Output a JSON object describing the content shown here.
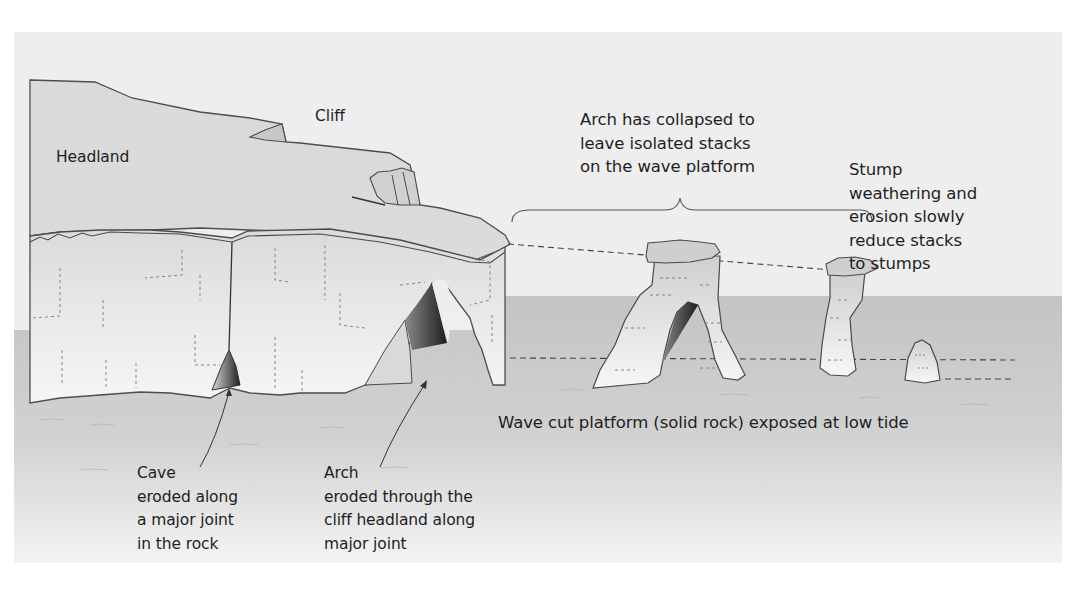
{
  "diagram": {
    "colors": {
      "sky_panel": "#eeeeee",
      "sea_platform": "#c9c9c9",
      "rock_fill": "#dcdcdc",
      "rock_face": "#ececec",
      "rock_outline": "#4a4a4a",
      "shadow_dark": "#3a3a3a",
      "text": "#1e1e1e"
    },
    "labels": {
      "headland": "Headland",
      "cliff": "Cliff",
      "stacks_note": "Arch has collapsed to\nleave isolated stacks\non the wave platform",
      "stump_note": "Stump\nweathering and\nerosion slowly\nreduce stacks\nto stumps",
      "platform_note": "Wave cut platform (solid rock) exposed at low tide",
      "cave_note": "Cave\neroded along\na major joint\nin the rock",
      "arch_note": "Arch\neroded through the\ncliff headland along\nmajor joint"
    },
    "features": [
      {
        "name": "headland",
        "type": "landform"
      },
      {
        "name": "cliff",
        "type": "landform"
      },
      {
        "name": "cave",
        "type": "landform"
      },
      {
        "name": "arch",
        "type": "landform"
      },
      {
        "name": "stack-with-arch",
        "type": "landform"
      },
      {
        "name": "stack",
        "type": "landform"
      },
      {
        "name": "stump",
        "type": "landform"
      },
      {
        "name": "wave-cut-platform",
        "type": "landform"
      }
    ]
  }
}
